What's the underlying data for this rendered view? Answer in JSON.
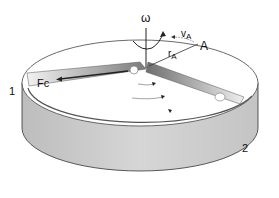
{
  "diagram": {
    "type": "rotating-disk-centrifugal-force",
    "labels": {
      "omega": "ω",
      "velocity": "v",
      "velocity_sub": "A",
      "radius": "r",
      "radius_sub": "A",
      "point": "A",
      "force": "Fc",
      "slot1": "1",
      "slot2": "2"
    },
    "colors": {
      "disk_top": "#ffffff",
      "disk_side": "#cfcfcf",
      "outline": "#333333",
      "slot_dark": "#8a8a8a",
      "slot_light": "#e6e6e6"
    }
  }
}
